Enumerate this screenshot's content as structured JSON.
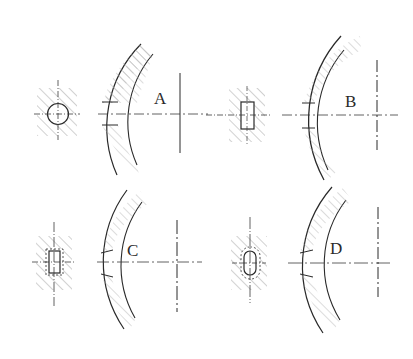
{
  "diagram": {
    "type": "technical-drawing",
    "colors": {
      "line": "#2a2a2a",
      "hatch": "#9a9a9a",
      "centerline": "#3a3a3a",
      "background": "#ffffff"
    },
    "panels": [
      {
        "id": "A",
        "label": "A",
        "section_shape": "circle",
        "section_center": [
          43,
          114
        ],
        "arc_center_x": 183,
        "centerline_y": 114,
        "axis_x": 180
      },
      {
        "id": "B",
        "label": "B",
        "section_shape": "rectangle",
        "section_center": [
          247,
          115
        ],
        "arc_center_x": 380,
        "centerline_y": 115,
        "axis_x": 377
      },
      {
        "id": "C",
        "label": "C",
        "section_shape": "rectangle-with-dashed-outline",
        "section_center": [
          53,
          262
        ],
        "arc_center_x": 180,
        "centerline_y": 262,
        "axis_x": 177
      },
      {
        "id": "D",
        "label": "D",
        "section_shape": "rounded-slot-with-dashed-outline",
        "section_center": [
          252,
          263
        ],
        "arc_center_x": 380,
        "centerline_y": 263,
        "axis_x": 378
      }
    ]
  }
}
